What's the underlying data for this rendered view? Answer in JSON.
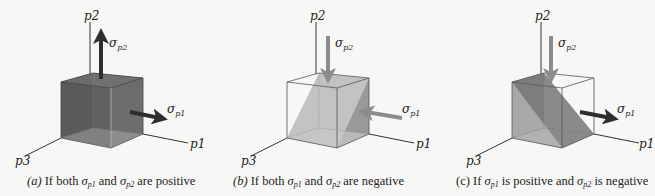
{
  "colors": {
    "background": "#f7f7f5",
    "axis": "#333333",
    "edge": "#444444",
    "dark_fill": "#5a5a5a",
    "light_fill": "#b8b8b8",
    "mid_fill": "#8a8a8a",
    "tension_arrow": "#2e2e2e",
    "compression_arrow": "#8c8c8c"
  },
  "axes": {
    "p1": "p1",
    "p2": "p2",
    "p3": "p3"
  },
  "stress": {
    "sigma": "σ",
    "p1_sub": "p1",
    "p2_sub": "p2"
  },
  "panels": [
    {
      "id": "a",
      "letter": "(a)",
      "caption_pre": "If both ",
      "caption_mid": " and ",
      "caption_post": " are positive",
      "sigma_p1": "positive",
      "sigma_p2": "positive"
    },
    {
      "id": "b",
      "letter": "(b)",
      "caption_pre": "If both ",
      "caption_mid": " and ",
      "caption_post": " are negative",
      "sigma_p1": "negative",
      "sigma_p2": "negative"
    },
    {
      "id": "c",
      "letter": "(c)",
      "caption_pre": "If ",
      "caption_mid": " is positive and ",
      "caption_post": " is negative",
      "sigma_p1": "positive",
      "sigma_p2": "negative"
    }
  ]
}
